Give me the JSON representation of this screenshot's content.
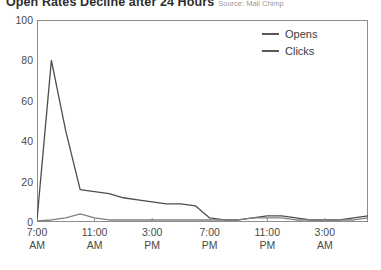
{
  "title": {
    "main": "Open Rates Decline after 24 Hours",
    "source": "Source: Mail Chimp"
  },
  "legend": {
    "position": "top-right",
    "items": [
      {
        "label": "Opens",
        "color": "#5a5a5a"
      },
      {
        "label": "Clicks",
        "color": "#5a5a5a"
      }
    ]
  },
  "axes": {
    "y": {
      "ticks": [
        "0",
        "20",
        "40",
        "60",
        "80",
        "100"
      ],
      "min": 0,
      "max": 100
    },
    "x": {
      "ticks": [
        {
          "line1": "7:00",
          "line2": "AM"
        },
        {
          "line1": "11:00",
          "line2": "AM"
        },
        {
          "line1": "3:00",
          "line2": "PM"
        },
        {
          "line1": "7:00",
          "line2": "PM"
        },
        {
          "line1": "11:00",
          "line2": "PM"
        },
        {
          "line1": "3:00",
          "line2": "AM"
        }
      ]
    }
  },
  "chart_data": {
    "type": "line",
    "title": "Open Rates Decline after 24 Hours",
    "subtitle": "Source: Mail Chimp",
    "xlabel": "",
    "ylabel": "",
    "ylim": [
      0,
      100
    ],
    "grid": false,
    "legend_position": "top-right",
    "x": [
      "7:00 AM",
      "8:00 AM",
      "9:00 AM",
      "10:00 AM",
      "11:00 AM",
      "12:00 PM",
      "1:00 PM",
      "2:00 PM",
      "3:00 PM",
      "4:00 PM",
      "5:00 PM",
      "6:00 PM",
      "7:00 PM",
      "8:00 PM",
      "9:00 PM",
      "10:00 PM",
      "11:00 PM",
      "12:00 AM",
      "1:00 AM",
      "2:00 AM",
      "3:00 AM",
      "4:00 AM",
      "5:00 AM",
      "6:00 AM"
    ],
    "series": [
      {
        "name": "Opens",
        "color": "#4d4d4d",
        "values": [
          1,
          80,
          45,
          16,
          15,
          14,
          12,
          11,
          10,
          9,
          9,
          8,
          2,
          1,
          1,
          2,
          3,
          3,
          2,
          1,
          1,
          1,
          2,
          3
        ]
      },
      {
        "name": "Clicks",
        "color": "#808080",
        "values": [
          0.5,
          1,
          2,
          4,
          2,
          1,
          1,
          1,
          1,
          1,
          1,
          1,
          1,
          1,
          1,
          2,
          2,
          2,
          1,
          1,
          1,
          1,
          1,
          2
        ]
      }
    ]
  }
}
